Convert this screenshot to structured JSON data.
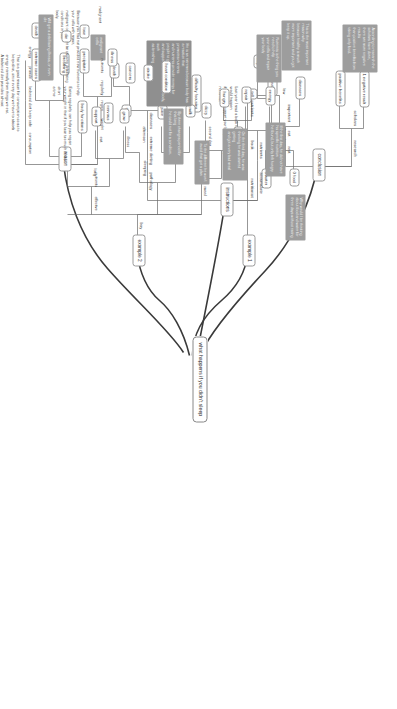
{
  "diagram": {
    "title": "what happens if you didn't sleep",
    "orientation": "rotated-90",
    "colors": {
      "note_fill": "#9d9d9d",
      "note_text": "#f4f4f4",
      "node_border": "#9a9a9a",
      "link": "#6a6a6a",
      "trunk": "#3a3a3a",
      "background": "#ffffff"
    }
  },
  "root": {
    "label": "what happens if you didn't sleep"
  },
  "branches": {
    "example1": {
      "label": "example 1"
    },
    "example2": {
      "label": "example 2"
    },
    "conclusion": {
      "label": "conclusion"
    },
    "instructions": {
      "label": "instructions"
    },
    "reason": {
      "label": "reason"
    }
  },
  "example1": {
    "chain": [
      "nutritionist",
      "book",
      "nutrients"
    ],
    "leaf_chain": [
      "law",
      "three days"
    ],
    "nodes": [
      "0 food",
      "0 water"
    ],
    "note": "Why would I be thinking\nabout food and water for\nthree days without eating",
    "paragraph": "Last year I read a book to a nutritionist about what\nwould happen\nif you didn't support your body with enough\nnutrients."
  },
  "example2": {
    "label": "example 2",
    "spine": [
      "boy",
      "effective",
      "nutrients"
    ],
    "row_meal": {
      "chain": [
        "meal",
        "first day",
        "second day"
      ],
      "nodes": [
        "0 specific nutrition",
        "tell",
        "hungry",
        "dizzy",
        "difficulty focusing"
      ],
      "note": "If the first day, he did not have his specific nutrition\nhe found, but only felt hungry"
    },
    "row_sleep": {
      "chain": [
        "sleeping",
        "third day",
        "afternoon"
      ],
      "nodes": [
        "milk",
        "juice",
        "feel",
        "nervous"
      ],
      "note": "On the third day, he was thinking he was started getting\nand got a very bad meal"
    },
    "row_illness": {
      "chain": [
        "long",
        "illness"
      ],
      "nodes": [
        "grow",
        "support",
        "body functions",
        "breathing",
        "extreme cases",
        "death"
      ],
      "note_a": "By three changes period for that long\nhe could not fix a condition.",
      "note_b": "He is an extremes because body has a reaction that\npromotes nutrients\nand nutrients provide energy for people to grow,\nand support all functions of the body, such\nas breathing"
    },
    "note_standalone": "To the different he won't avoid that got a plan"
  },
  "conclusion": {
    "label": "conclusion",
    "row_top": {
      "chain": [
        "research",
        "scholars"
      ],
      "nodes": [
        "1 negative result",
        "positive benefits"
      ],
      "note": "According to research the scholars have done,\nthere are more negative results\nthan positive benefits from taking only food."
    },
    "row_bottom": {
      "chain": [
        "rest",
        "eat",
        "important"
      ],
      "nodes": [
        "diseases",
        "healthy",
        "stay"
      ],
      "note": "This is the most important reason why\nbecause healthy is much more important and you got keep it up."
    }
  },
  "instructions": {
    "label": "instructions",
    "row_nutrients": {
      "chain": [
        "accumulate",
        "nutrients"
      ],
      "nodes": [
        "energy",
        "repair"
      ],
      "note": "Nutrients is the thing you need to help\nyour cells and repair\nyour body"
    },
    "row_pathology": {
      "chain": [
        "pathology",
        "extreme dieting",
        "diseases"
      ],
      "nodes": [
        "heart condition",
        "stroke",
        "cancers",
        "death"
      ],
      "leaf": "malignant",
      "note": "malignant cells",
      "paragraph": "Because you had not provided new nutrients to help\nyour cells with repair,\nmalignant cells might be causing debilitating\nconditions in your\nbody."
    }
  },
  "reason": {
    "label": "reason",
    "row_eat": {
      "chain": [
        "eat",
        "weight",
        "regain",
        "regularly",
        "nutrients"
      ],
      "nodes": [
        "illness",
        "precipitate",
        "lose",
        "die"
      ],
      "note": "Will get a debilitating illness, or even die",
      "paragraph": "Eating regularly can help you regain\nyour weight in that if you lose too much in too short\na time"
    },
    "row_consumption": {
      "chain": [
        "consumption",
        "keep safe",
        "balanced diet",
        "provide",
        "energy"
      ],
      "paragraph": "That is a good reason for consumption so as to\nkeep alive, since every day we have to absorb\nenergy internally from things we eat.\nA balanced diet provides almost\neverything you need during the day in order to\nkeep active."
    }
  }
}
